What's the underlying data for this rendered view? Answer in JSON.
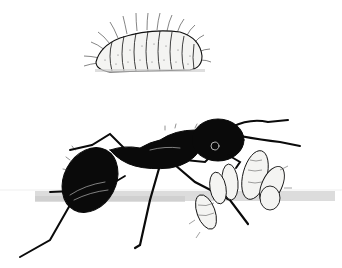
{
  "illustration": {
    "subject": "ant tending caterpillar larvae",
    "style": "black and white stipple ink drawing",
    "colors": {
      "background": "#ffffff",
      "ink": "#0a0a0a",
      "shadow": "#d4d4d4",
      "larva_fill": "#f4f4f2"
    },
    "elements": [
      {
        "name": "caterpillar-top",
        "description": "segmented hairy caterpillar, upper center"
      },
      {
        "name": "ant",
        "description": "black ant, side view, walking right"
      },
      {
        "name": "larvae-cluster",
        "description": "cluster of pale segmented larvae near ant head"
      },
      {
        "name": "ground-shadow",
        "description": "grey horizontal shading band"
      }
    ]
  }
}
